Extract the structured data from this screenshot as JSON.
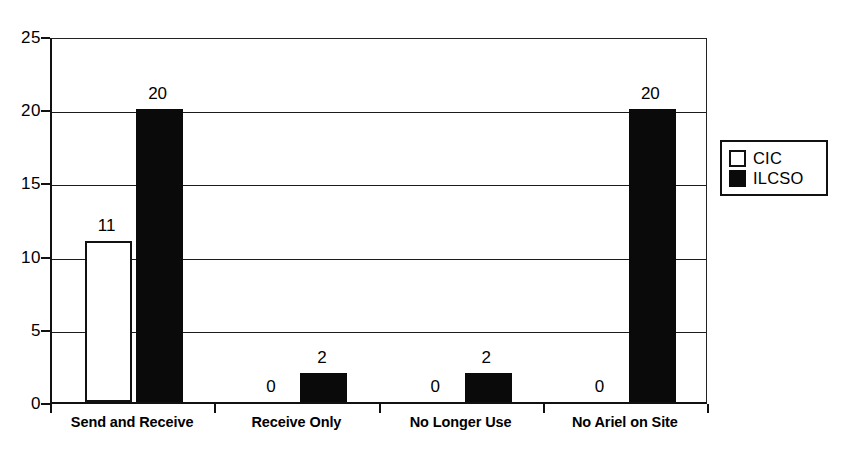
{
  "chart_data": {
    "type": "bar",
    "title": "",
    "xlabel": "",
    "ylabel": "",
    "categories": [
      "Send and Receive",
      "Receive Only",
      "No Longer Use",
      "No Ariel on Site"
    ],
    "series": [
      {
        "name": "CIC",
        "values": [
          11,
          0,
          0,
          0
        ],
        "color": "#ffffff",
        "swatch": "open"
      },
      {
        "name": "ILCSO",
        "values": [
          20,
          2,
          2,
          20
        ],
        "color": "#0a0a0a",
        "swatch": "filled"
      }
    ],
    "ylim": [
      0,
      25
    ],
    "yticks": [
      0,
      5,
      10,
      15,
      20,
      25
    ],
    "ytick_labels": [
      "0",
      "5",
      "10",
      "15",
      "20",
      "25"
    ],
    "data_labels": [
      {
        "category": "Send and Receive",
        "series": "CIC",
        "text": "11"
      },
      {
        "category": "Send and Receive",
        "series": "ILCSO",
        "text": "20"
      },
      {
        "category": "Receive Only",
        "series": "CIC",
        "text": "0"
      },
      {
        "category": "Receive Only",
        "series": "ILCSO",
        "text": "2"
      },
      {
        "category": "No Longer Use",
        "series": "CIC",
        "text": "0"
      },
      {
        "category": "No Longer Use",
        "series": "ILCSO",
        "text": "2"
      },
      {
        "category": "No Ariel on Site",
        "series": "CIC",
        "text": "0"
      },
      {
        "category": "No Ariel on Site",
        "series": "ILCSO",
        "text": "20"
      }
    ],
    "grid": true,
    "grid_axis": "y",
    "legend_position": "right",
    "legend_entries": [
      "CIC",
      "ILCSO"
    ],
    "show_data_labels": true,
    "background_color": "#ffffff",
    "axis_color": "#111111"
  }
}
